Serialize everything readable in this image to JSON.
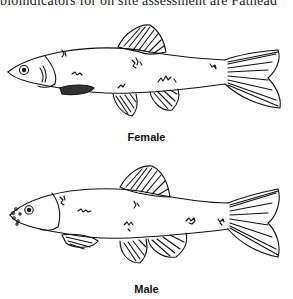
{
  "document": {
    "top_text": "bioindicators for on site assessment are Fathead",
    "figures": [
      {
        "label": "Female",
        "subject": "fathead-minnow-female-drawing"
      },
      {
        "label": "Male",
        "subject": "fathead-minnow-male-drawing"
      }
    ]
  }
}
